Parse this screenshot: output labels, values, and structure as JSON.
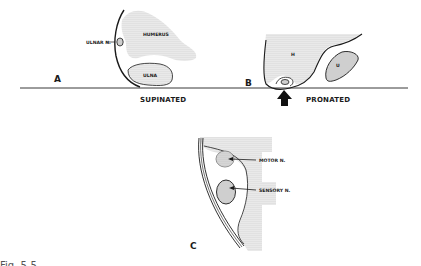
{
  "figure": {
    "panels": [
      {
        "id": "A",
        "label": "A",
        "state": "SUPINATED",
        "structures": [
          "HUMERUS",
          "ULNA"
        ],
        "nerve_label": "ULNAR N."
      },
      {
        "id": "B",
        "label": "B",
        "state": "PRONATED",
        "structures": [
          "H",
          "U"
        ]
      },
      {
        "id": "C",
        "label": "C",
        "nerve_labels": [
          "MOTOR N.",
          "SENSORY N."
        ]
      }
    ],
    "caption_truncated": "Fig. 5-5 ..."
  },
  "colors": {
    "ink": "#1a1a1a",
    "stipple": "#9a9a9a",
    "background": "#ffffff"
  }
}
